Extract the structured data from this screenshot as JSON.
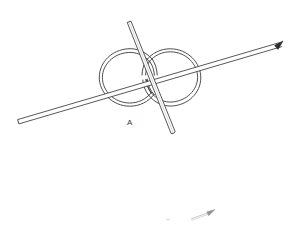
{
  "figure": {
    "domain_note": "technical line drawing",
    "background_color": "#ffffff",
    "line_color": "#3a3a3a",
    "line_color_light": "#8a8a8a",
    "width": 294,
    "height": 225,
    "labels": [
      {
        "id": "A",
        "text": "A",
        "x": 127,
        "y": 119
      }
    ],
    "parts": {
      "figure_eight_loop": {
        "name": "figure-eight-wire-loop",
        "left_circle": {
          "cx": 130,
          "cy": 78,
          "rx": 30,
          "ry": 27
        },
        "right_circle": {
          "cx": 171,
          "cy": 78,
          "rx": 30,
          "ry": 27
        },
        "stroke_width": 1,
        "tube_offset": 2.5
      },
      "long_rod": {
        "name": "long-diagonal-rod",
        "start": {
          "x": 17,
          "y": 119
        },
        "end": {
          "x": 281,
          "y": 42
        },
        "tube_width": 3.2,
        "tip_start": "blunt",
        "tip_end": "arrowhead"
      },
      "short_rod": {
        "name": "near-vertical-rod",
        "start": {
          "x": 128,
          "y": 22
        },
        "end": {
          "x": 173,
          "y": 133
        },
        "tube_width": 3.6,
        "tip_start": "blunt",
        "tip_end": "blunt"
      },
      "faint_arrow": {
        "name": "faint-partial-arrow",
        "start": {
          "x": 191,
          "y": 219
        },
        "end": {
          "x": 214,
          "y": 210
        },
        "opacity": 0.45,
        "tip_end": "arrowhead"
      },
      "faint_tick": {
        "name": "faint-tick-mark",
        "x": 167,
        "y": 219,
        "length": 4,
        "opacity": 0.35
      }
    }
  }
}
